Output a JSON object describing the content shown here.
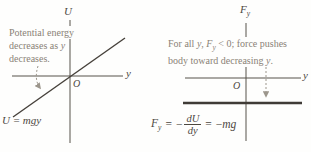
{
  "figure": {
    "background": "#fefefd",
    "axis_color": "#57524b",
    "curve_color": "#46413b",
    "force_line_color": "#3f3b36",
    "label_color": "#4c473f",
    "annotation_color": "#8a8277",
    "arrow_color": "#9c968c"
  },
  "left_graph": {
    "y_axis_label": "U",
    "x_axis_label": "y",
    "origin_label": "O",
    "annotation": {
      "line1": "Potential energy",
      "line2a": "decreases as ",
      "line2b": "y",
      "line3": "decreases."
    },
    "line_equation": "U = mgy"
  },
  "right_graph": {
    "y_axis_label_main": "F",
    "y_axis_label_sub": "y",
    "x_axis_label": "y",
    "origin_label": "O",
    "annotation": {
      "l1s1": "For all ",
      "l1s2": "y",
      "l1s3": ", ",
      "l1s4": "F",
      "l1s5": "y",
      "l1s6": " < 0; force pushes",
      "l2s1": "body toward decreasing ",
      "l2s2": "y",
      "l2s3": "."
    },
    "equation": {
      "lhs": "F",
      "lhs_sub": "y",
      "equals1": "=",
      "minus1": "−",
      "frac_num": "dU",
      "frac_den": "dy",
      "equals2": "=",
      "minus2": "−",
      "rhs": "mg"
    }
  }
}
